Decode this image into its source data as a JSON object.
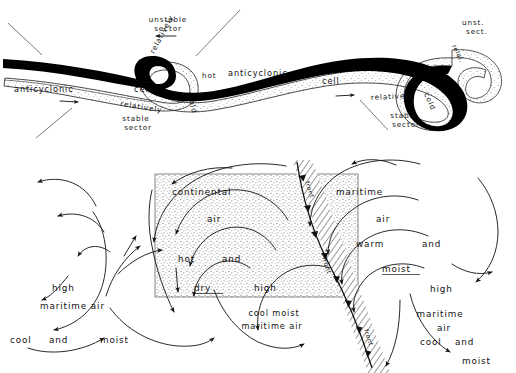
{
  "figure": {
    "width": 516,
    "height": 373,
    "background_color": "#ffffff",
    "ink_color": "#111111",
    "stipple_color": "#8a8a8a"
  },
  "upper_panel": {
    "name": "anticyclonic-wave-panel",
    "labels": {
      "unstable_sector": "unstable\nsector",
      "unstable_sector_line1": "unstable",
      "unstable_sector_line2": "sector",
      "stable_sector_line1": "stable",
      "stable_sector_line2": "sector",
      "anticyclonic_left": "anticyclonic",
      "cell_left": "cell",
      "anticyclonic_right": "anticyclonic",
      "cell_right": "cell",
      "relatively_hot_a": "relatively",
      "relatively_hot_b": "hot",
      "relatively_cold_left_a": "relatively",
      "relatively_cold_left_b": "cold",
      "relatively_cold_right_a": "relatively",
      "relatively_cold_right_b": "cold",
      "unst_sect_line1": "unst.",
      "unst_sect_line2": "sect.",
      "relat_short": "relat."
    }
  },
  "lower_panel": {
    "name": "surface-airflow-panel",
    "continental_box": {
      "label_line1": "continental",
      "label_line2": "air",
      "label_line3a": "hot",
      "label_line3b": "and",
      "label_line4": "dry"
    },
    "maritime_right": {
      "label_line1": "maritime",
      "label_line2": "air",
      "label_line3a": "warm",
      "label_line3b": "and",
      "label_line4": "moist"
    },
    "maritime_left": {
      "high": "high",
      "line1": "maritime   air",
      "line2a": "cool",
      "line2b": "and",
      "line2c": "moist"
    },
    "maritime_far_right": {
      "high": "high",
      "line1": "maritime",
      "line2": "air",
      "line3a": "cool",
      "line3b": "and",
      "line4": "moist"
    },
    "cool_moist_center": {
      "line1": "cool   moist",
      "line2": "maritime  air"
    },
    "high_center_left": "high",
    "high_center_right": "high",
    "front_label_upper": "front",
    "front_label_mid": "front",
    "front_label_lower": "front"
  }
}
